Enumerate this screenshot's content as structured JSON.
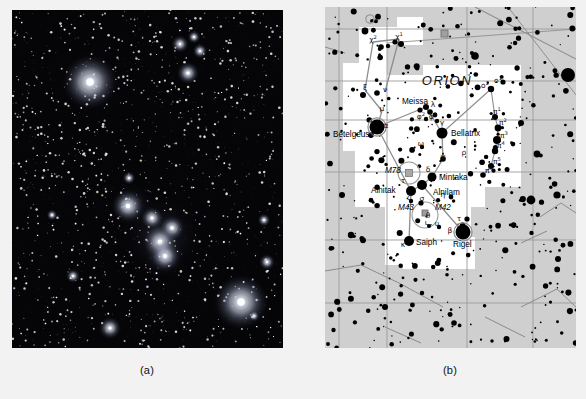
{
  "figure": {
    "panels": [
      {
        "id": "photo",
        "caption": "(a)",
        "kind": "photograph",
        "description": "Long-exposure photograph of the constellation Orion on a black sky background"
      },
      {
        "id": "chart",
        "caption": "(b)",
        "kind": "star-chart",
        "description": "Star atlas chart of the constellation Orion with labelled stars and deep-sky objects"
      }
    ]
  },
  "chart": {
    "constellation_label": "ORION",
    "background_color": "#cfcfcf",
    "boundary_fill_color": "#ffffff",
    "star_color": "#000000",
    "line_color": "#8a8a8a",
    "named_stars": [
      {
        "name": "Betelgeuse",
        "bayer": "α",
        "x": 52,
        "y": 120,
        "r": 7.5,
        "label_x": 8,
        "label_y": 130
      },
      {
        "name": "Bellatrix",
        "bayer": "γ",
        "x": 117,
        "y": 126,
        "r": 5.5,
        "label_x": 126,
        "label_y": 129
      },
      {
        "name": "Meissa",
        "bayer": "λ",
        "x": 101,
        "y": 100,
        "r": 3.0,
        "label_x": 77,
        "label_y": 97
      },
      {
        "name": "Mintaka",
        "bayer": "δ",
        "x": 107,
        "y": 170,
        "r": 4.5,
        "label_x": 114,
        "label_y": 173
      },
      {
        "name": "Alnilam",
        "bayer": "ε",
        "x": 97,
        "y": 178,
        "r": 5.0,
        "label_x": 108,
        "label_y": 188
      },
      {
        "name": "Alnitak",
        "bayer": "ζ",
        "x": 86,
        "y": 184,
        "r": 5.0,
        "label_x": 46,
        "label_y": 186
      },
      {
        "name": "Saiph",
        "bayer": "κ",
        "x": 84,
        "y": 234,
        "r": 5.0,
        "label_x": 91,
        "label_y": 238
      },
      {
        "name": "Rigel",
        "bayer": "β",
        "x": 138,
        "y": 225,
        "r": 7.5,
        "label_x": 128,
        "label_y": 240
      }
    ],
    "deep_sky_objects": [
      {
        "name": "M78",
        "type": "reflection-nebula",
        "x": 84,
        "y": 166,
        "label_x": 60,
        "label_y": 166
      },
      {
        "name": "M42",
        "type": "emission-nebula",
        "x": 103,
        "y": 205,
        "label_x": 110,
        "label_y": 203
      },
      {
        "name": "M43",
        "type": "emission-nebula",
        "x": 97,
        "y": 205,
        "label_x": 73,
        "label_y": 203
      }
    ],
    "greek_labels": [
      {
        "text": "χ",
        "sup": "2",
        "x": 48,
        "y": 35
      },
      {
        "text": "χ",
        "sup": "1",
        "x": 74,
        "y": 32
      },
      {
        "text": "ξ",
        "sup": "",
        "x": 40,
        "y": 83
      },
      {
        "text": "ν",
        "sup": "",
        "x": 60,
        "y": 85
      },
      {
        "text": "μ",
        "sup": "",
        "x": 57,
        "y": 104
      },
      {
        "text": "λ",
        "sup": "",
        "x": 108,
        "y": 100
      },
      {
        "text": "α",
        "sup": "",
        "x": 61,
        "y": 121
      },
      {
        "text": "φ",
        "sup": "2",
        "x": 96,
        "y": 112
      },
      {
        "text": "φ",
        "sup": "1",
        "x": 108,
        "y": 112
      },
      {
        "text": "γ",
        "sup": "",
        "x": 117,
        "y": 118
      },
      {
        "text": "ω",
        "sup": "",
        "x": 96,
        "y": 139
      },
      {
        "text": "ψ",
        "sup": "",
        "x": 118,
        "y": 152
      },
      {
        "text": "ρ",
        "sup": "",
        "x": 139,
        "y": 148
      },
      {
        "text": "δ",
        "sup": "",
        "x": 103,
        "y": 165
      },
      {
        "text": "τ",
        "sup": "",
        "x": 78,
        "y": 176
      },
      {
        "text": "ζ",
        "sup": "",
        "x": 84,
        "y": 193
      },
      {
        "text": "σ",
        "sup": "",
        "x": 97,
        "y": 194
      },
      {
        "text": "η",
        "sup": "",
        "x": 118,
        "y": 190
      },
      {
        "text": "θ",
        "sup": "",
        "x": 103,
        "y": 211
      },
      {
        "text": "ι",
        "sup": "",
        "x": 101,
        "y": 218
      },
      {
        "text": "υ",
        "sup": "",
        "x": 112,
        "y": 219
      },
      {
        "text": "τ",
        "sup": "",
        "x": 134,
        "y": 214
      },
      {
        "text": "β",
        "sup": "",
        "x": 125,
        "y": 226
      },
      {
        "text": "κ",
        "sup": "",
        "x": 78,
        "y": 240
      },
      {
        "text": "o",
        "sup": "1",
        "x": 173,
        "y": 76
      },
      {
        "text": "o",
        "sup": "2",
        "x": 160,
        "y": 81
      },
      {
        "text": "π",
        "sup": "1",
        "x": 172,
        "y": 107
      },
      {
        "text": "π",
        "sup": "2",
        "x": 178,
        "y": 118
      },
      {
        "text": "π",
        "sup": "3",
        "x": 179,
        "y": 131
      },
      {
        "text": "π",
        "sup": "4",
        "x": 176,
        "y": 141
      },
      {
        "text": "π",
        "sup": "5",
        "x": 172,
        "y": 157
      },
      {
        "text": "π",
        "sup": "6",
        "x": 164,
        "y": 166
      }
    ],
    "asterism_lines": [
      [
        52,
        120,
        101,
        100
      ],
      [
        101,
        100,
        117,
        126
      ],
      [
        52,
        120,
        86,
        184
      ],
      [
        117,
        126,
        118,
        152
      ],
      [
        118,
        152,
        107,
        170
      ],
      [
        107,
        170,
        97,
        178
      ],
      [
        97,
        178,
        86,
        184
      ],
      [
        86,
        184,
        84,
        234
      ],
      [
        97,
        178,
        138,
        225
      ],
      [
        52,
        120,
        57,
        104
      ],
      [
        57,
        104,
        40,
        83
      ],
      [
        40,
        83,
        48,
        35
      ],
      [
        48,
        35,
        74,
        32
      ],
      [
        74,
        32,
        60,
        85
      ]
    ]
  }
}
